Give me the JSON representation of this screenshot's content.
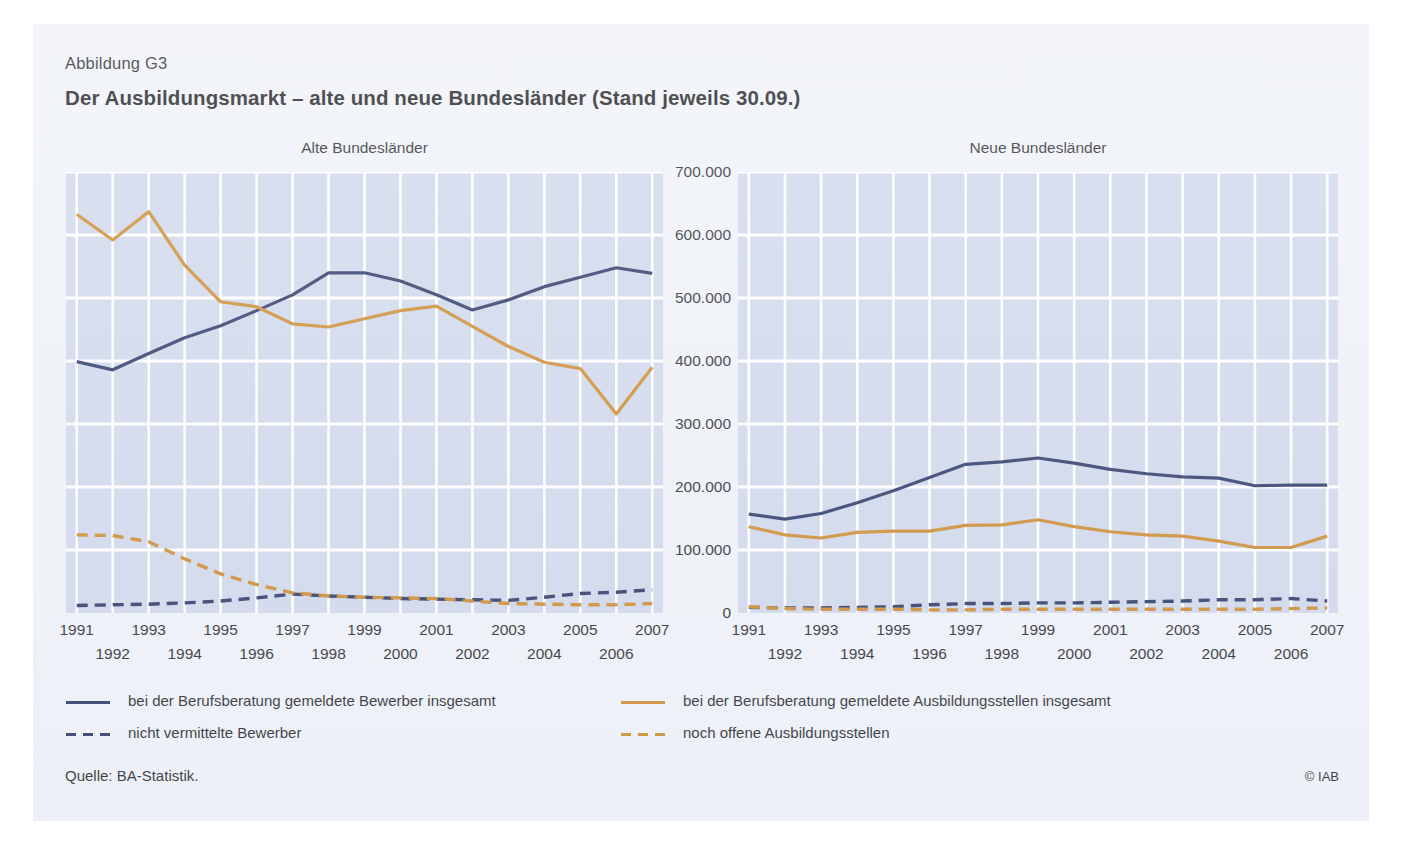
{
  "figure_number": "Abbildung G3",
  "title": "Der Ausbildungsmarkt – alte und neue Bundesländer (Stand jeweils 30.09.)",
  "source": "Quelle: BA-Statistik.",
  "copyright": "© IAB",
  "colors": {
    "navy": "#1d2a5c",
    "orange": "#c9821f",
    "panel_bg": "#ccd5ea",
    "figure_bg": "#eef1f7",
    "gridline": "#ffffff"
  },
  "legend": [
    {
      "label": "bei der Berufsberatung gemeldete Bewerber insgesamt",
      "style": "solid",
      "color": "#1d2a5c"
    },
    {
      "label": "bei der Berufsberatung gemeldete Ausbildungsstellen insgesamt",
      "style": "solid",
      "color": "#c9821f"
    },
    {
      "label": "nicht vermittelte Bewerber",
      "style": "dashed",
      "color": "#1d2a5c"
    },
    {
      "label": "noch offene Ausbildungsstellen",
      "style": "dashed",
      "color": "#c9821f"
    }
  ],
  "axis": {
    "y_ticks": [
      "0",
      "100.000",
      "200.000",
      "300.000",
      "400.000",
      "500.000",
      "600.000",
      "700.000"
    ],
    "y_min": 0,
    "y_max": 700000,
    "y_step": 100000,
    "x_ticks_row0": [
      "1991",
      "1993",
      "1995",
      "1997",
      "1999",
      "2001",
      "2003",
      "2005",
      "2007"
    ],
    "x_ticks_row1": [
      "1992",
      "1994",
      "1996",
      "1998",
      "2000",
      "2002",
      "2004",
      "2006"
    ]
  },
  "chart_data": [
    {
      "type": "line",
      "title": "Alte Bundesländer",
      "xlabel": "",
      "ylabel": "",
      "ylim": [
        0,
        700000
      ],
      "grid": true,
      "legend_position": "below",
      "x": [
        1991,
        1992,
        1993,
        1994,
        1995,
        1996,
        1997,
        1998,
        1999,
        2000,
        2001,
        2002,
        2003,
        2004,
        2005,
        2006,
        2007
      ],
      "series": [
        {
          "name": "bei der Berufsberatung gemeldete Bewerber insgesamt",
          "style": "solid",
          "color": "#1d2a5c",
          "values": [
            399000,
            386000,
            412000,
            437000,
            456000,
            480000,
            505000,
            540000,
            540000,
            527000,
            505000,
            481000,
            497000,
            518000,
            533000,
            548000,
            539000
          ]
        },
        {
          "name": "bei der Berufsberatung gemeldete Ausbildungsstellen insgesamt",
          "style": "solid",
          "color": "#c9821f",
          "values": [
            633000,
            592000,
            637000,
            552000,
            494000,
            486000,
            459000,
            454000,
            467000,
            480000,
            487000,
            455000,
            423000,
            398000,
            388000,
            316000,
            390000
          ]
        },
        {
          "name": "nicht vermittelte Bewerber",
          "style": "dashed",
          "color": "#1d2a5c",
          "values": [
            12000,
            13000,
            14000,
            16000,
            19000,
            24000,
            30000,
            27000,
            25000,
            23000,
            22000,
            21000,
            20000,
            25000,
            31000,
            33000,
            37000
          ]
        },
        {
          "name": "noch offene Ausbildungsstellen",
          "style": "dashed",
          "color": "#c9821f",
          "values": [
            124000,
            123000,
            113000,
            86000,
            62000,
            45000,
            32000,
            27000,
            25000,
            24000,
            23000,
            19000,
            15000,
            14000,
            13000,
            13000,
            15000
          ]
        }
      ]
    },
    {
      "type": "line",
      "title": "Neue Bundesländer",
      "xlabel": "",
      "ylabel": "",
      "ylim": [
        0,
        700000
      ],
      "grid": true,
      "legend_position": "below",
      "x": [
        1991,
        1992,
        1993,
        1994,
        1995,
        1996,
        1997,
        1998,
        1999,
        2000,
        2001,
        2002,
        2003,
        2004,
        2005,
        2006,
        2007
      ],
      "series": [
        {
          "name": "bei der Berufsberatung gemeldete Bewerber insgesamt",
          "style": "solid",
          "color": "#1d2a5c",
          "values": [
            157000,
            149000,
            158000,
            175000,
            194000,
            215000,
            236000,
            240000,
            246000,
            238000,
            228000,
            221000,
            216000,
            214000,
            202000,
            203000,
            203000
          ]
        },
        {
          "name": "bei der Berufsberatung gemeldete Ausbildungsstellen insgesamt",
          "style": "solid",
          "color": "#c9821f",
          "values": [
            137000,
            124000,
            119000,
            128000,
            130000,
            130000,
            139000,
            140000,
            148000,
            137000,
            129000,
            124000,
            122000,
            114000,
            104000,
            104000,
            122000
          ]
        },
        {
          "name": "nicht vermittelte Bewerber",
          "style": "dashed",
          "color": "#1d2a5c",
          "values": [
            9000,
            8000,
            8000,
            9000,
            10000,
            13000,
            15000,
            15000,
            16000,
            16000,
            17000,
            18000,
            19000,
            21000,
            21000,
            23000,
            19000
          ]
        },
        {
          "name": "noch offene Ausbildungsstellen",
          "style": "dashed",
          "color": "#c9821f",
          "values": [
            10000,
            7000,
            6000,
            6000,
            6000,
            5000,
            5000,
            6000,
            6000,
            6000,
            6000,
            6000,
            6000,
            6000,
            6000,
            7000,
            8000
          ]
        }
      ]
    }
  ]
}
